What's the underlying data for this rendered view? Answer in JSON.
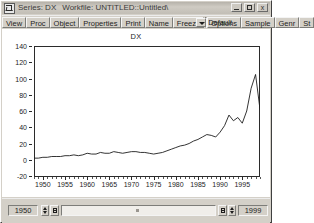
{
  "window": {
    "title_object": "Series: DX",
    "title_workfile": "Workfile: UNTITLED::Untitled\\",
    "sys_icon": "series-icon",
    "buttons": {
      "minimize": "minimize-icon",
      "maximize": "maximize-icon",
      "close": "x"
    }
  },
  "toolbar": {
    "buttons": [
      {
        "label": "View"
      },
      {
        "label": "Proc"
      },
      {
        "label": "Object"
      },
      {
        "label": "Properties"
      },
      {
        "label": "Print"
      },
      {
        "label": "Name"
      },
      {
        "label": "Freeze"
      }
    ],
    "combo": {
      "value": "Default",
      "arrow": "chevron-down-icon"
    },
    "buttons_right": [
      {
        "label": "Options"
      },
      {
        "label": "Sample"
      },
      {
        "label": "Genr"
      },
      {
        "label": "St"
      }
    ]
  },
  "sample_bar": {
    "start": "1950",
    "end": "1999"
  },
  "chart_data": {
    "type": "line",
    "title": "DX",
    "xlabel": "",
    "ylabel": "",
    "grid": false,
    "legend": "none",
    "line_color": "#1d1d1d",
    "xlim": [
      1948,
      1999
    ],
    "ylim": [
      -20,
      140
    ],
    "ytick_labels": [
      "140",
      "120",
      "100",
      "80",
      "60",
      "40",
      "20",
      "0",
      "-20"
    ],
    "yticks": [
      140,
      120,
      100,
      80,
      60,
      40,
      20,
      0,
      -20
    ],
    "xtick_labels": [
      "1950",
      "1955",
      "1960",
      "1965",
      "1970",
      "1975",
      "1980",
      "1985",
      "1990",
      "1995"
    ],
    "xticks": [
      1950,
      1955,
      1960,
      1965,
      1970,
      1975,
      1980,
      1985,
      1990,
      1995
    ],
    "x": [
      1948,
      1949,
      1950,
      1951,
      1952,
      1953,
      1954,
      1955,
      1956,
      1957,
      1958,
      1959,
      1960,
      1961,
      1962,
      1963,
      1964,
      1965,
      1966,
      1967,
      1968,
      1969,
      1970,
      1971,
      1972,
      1973,
      1974,
      1975,
      1976,
      1977,
      1978,
      1979,
      1980,
      1981,
      1982,
      1983,
      1984,
      1985,
      1986,
      1987,
      1988,
      1989,
      1990,
      1991,
      1992,
      1993,
      1994,
      1995,
      1996,
      1997,
      1998,
      1999
    ],
    "y": [
      2,
      2,
      3,
      3,
      4,
      4,
      4,
      5,
      5,
      6,
      5,
      6,
      8,
      7,
      7,
      9,
      8,
      8,
      10,
      9,
      8,
      9,
      10,
      10,
      9,
      9,
      8,
      7,
      8,
      9,
      11,
      13,
      15,
      17,
      18,
      20,
      23,
      25,
      28,
      31,
      30,
      28,
      34,
      42,
      55,
      48,
      52,
      45,
      60,
      88,
      105,
      62,
      96,
      138
    ]
  }
}
